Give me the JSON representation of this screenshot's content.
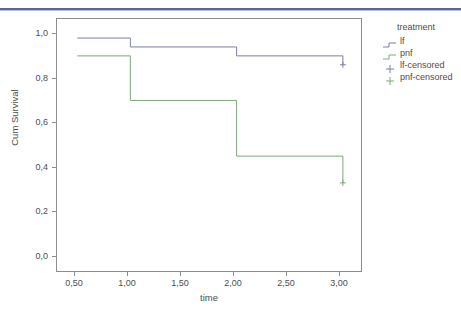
{
  "header": {
    "rule_color": "#5a62a0"
  },
  "chart_data": {
    "type": "line",
    "subtype": "kaplan-meier-step",
    "title": "",
    "xlabel": "time",
    "ylabel": "Cum Survival",
    "xlim": [
      0.3,
      3.18
    ],
    "ylim": [
      -0.07,
      1.07
    ],
    "xticks": [
      0.5,
      1.0,
      1.5,
      2.0,
      2.5,
      3.0
    ],
    "xtick_labels": [
      "0,50",
      "1,00",
      "1,50",
      "2,00",
      "2,50",
      "3,00"
    ],
    "yticks": [
      0.0,
      0.2,
      0.4,
      0.6,
      0.8,
      1.0
    ],
    "ytick_labels": [
      "0,0",
      "0,2",
      "0,4",
      "0,6",
      "0,8",
      "1,0"
    ],
    "grid": false,
    "legend_position": "right",
    "legend_title": "treatment",
    "series": [
      {
        "name": "lf",
        "color": "#7b7fa8",
        "steps": [
          {
            "x": 0.5,
            "y": 0.98
          },
          {
            "x": 1.0,
            "y": 0.98
          },
          {
            "x": 1.0,
            "y": 0.94
          },
          {
            "x": 2.0,
            "y": 0.94
          },
          {
            "x": 2.0,
            "y": 0.9
          },
          {
            "x": 3.0,
            "y": 0.9
          },
          {
            "x": 3.0,
            "y": 0.86
          }
        ],
        "censored_points": [
          {
            "x": 3.0,
            "y": 0.86
          }
        ]
      },
      {
        "name": "pnf",
        "color": "#7aa87a",
        "steps": [
          {
            "x": 0.5,
            "y": 0.9
          },
          {
            "x": 1.0,
            "y": 0.9
          },
          {
            "x": 1.0,
            "y": 0.7
          },
          {
            "x": 2.0,
            "y": 0.7
          },
          {
            "x": 2.0,
            "y": 0.45
          },
          {
            "x": 3.0,
            "y": 0.45
          },
          {
            "x": 3.0,
            "y": 0.33
          }
        ],
        "censored_points": [
          {
            "x": 3.0,
            "y": 0.33
          }
        ]
      }
    ]
  },
  "legend": {
    "title": "treatment",
    "entries": [
      {
        "label": "lf",
        "marker": "step-line",
        "color": "#7b7fa8"
      },
      {
        "label": "pnf",
        "marker": "step-line",
        "color": "#7aa87a"
      },
      {
        "label": "lf-censored",
        "marker": "plus",
        "color": "#7b7fa8"
      },
      {
        "label": "pnf-censored",
        "marker": "plus",
        "color": "#7aa87a"
      }
    ]
  }
}
